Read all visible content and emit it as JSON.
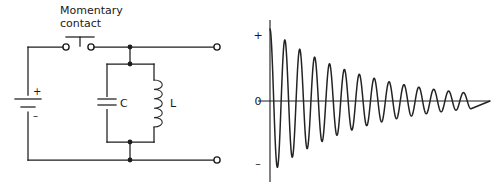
{
  "figure": {
    "background_color": "#ffffff",
    "ink_color": "#1d1d1d",
    "width": 502,
    "height": 196
  },
  "circuit": {
    "switch_label_line1": "Momentary",
    "switch_label_line2": "contact",
    "battery": {
      "plus_label": "+",
      "minus_label": "–"
    },
    "capacitor_label": "C",
    "inductor_label": "L",
    "terminals": {
      "switch_left": "switch-terminal-left",
      "switch_right": "switch-terminal-right",
      "output_top": "output-terminal-top",
      "output_bottom": "output-terminal-bottom"
    }
  },
  "chart_data": {
    "type": "line",
    "title": "",
    "xlabel": "",
    "ylabel": "",
    "ytick_labels": [
      "+",
      "0",
      "–"
    ],
    "ytick_values": [
      1,
      0,
      -1
    ],
    "xtick_labels": [],
    "grid": false,
    "legend": null,
    "ylim": [
      -1.15,
      1.15
    ],
    "xlim": [
      0,
      13.6
    ],
    "series": [
      {
        "name": "damped oscillation",
        "description": "Exponentially decaying cosine, starts at maximum positive amplitude at t=0",
        "amplitude_initial": 1.0,
        "decay_constant": 0.165,
        "cycles": 13.5,
        "points_per_cycle": 72,
        "formula": "y = exp(-0.165*t) * cos(2*pi*t)"
      }
    ]
  }
}
